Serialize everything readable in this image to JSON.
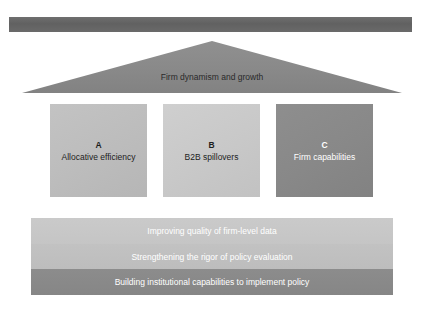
{
  "figure": {
    "cropped_top_text": "",
    "roof": {
      "label": "Firm dynamism and growth",
      "fill_color": "#8a8a8a"
    },
    "top_bar": {
      "color": "#656565"
    },
    "pillars": [
      {
        "letter": "A",
        "title": "Allocative efficiency",
        "color": "#bdbdbd"
      },
      {
        "letter": "B",
        "title": "B2B spillovers",
        "color": "#c9c9c9"
      },
      {
        "letter": "C",
        "title": "Firm capabilities",
        "color": "#888888"
      }
    ],
    "foundation": [
      {
        "label": "Improving quality of firm-level data",
        "color": "#c7c7c7"
      },
      {
        "label": "Strengthening the rigor of policy evaluation",
        "color": "#bfbfbf"
      },
      {
        "label": "Building institutional capabilities to implement policy",
        "color": "#898989"
      }
    ]
  }
}
